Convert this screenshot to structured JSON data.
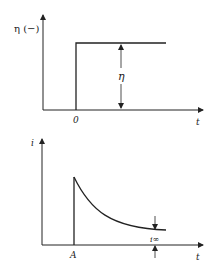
{
  "top_plot": {
    "y_label": "η (−)",
    "x_label": "t",
    "origin_label": "0",
    "step_label": "η",
    "description": "Step change in overpotential η at t = 0"
  },
  "bottom_plot": {
    "y_label": "i",
    "x_label": "t",
    "start_label": "A",
    "limit_label": "i∞",
    "description": "Current decays from peak at A toward steady-state i∞"
  },
  "colors": {
    "line": "#222222",
    "background": "#ffffff"
  }
}
